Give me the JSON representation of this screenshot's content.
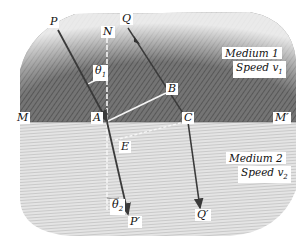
{
  "diagram": {
    "colors": {
      "medium1": "#6e6e6e",
      "medium2": "#d8d8d8",
      "background": "#ffffff",
      "ray": "#3a3a3a",
      "construction_line": "#f2f2f2"
    },
    "points": {
      "P": "P",
      "Q": "Q",
      "N": "N",
      "A": "A",
      "B": "B",
      "C": "C",
      "E": "E",
      "M": "M",
      "M_prime": "M′",
      "P_prime": "P′",
      "Q_prime": "Q′"
    },
    "angles": {
      "theta1": "θ",
      "theta1_sub": "1",
      "theta2": "θ",
      "theta2_sub": "2"
    },
    "medium1": {
      "name": "Medium 1",
      "speed_label": "Speed v",
      "speed_sub": "1"
    },
    "medium2": {
      "name": "Medium 2",
      "speed_label": "Speed v",
      "speed_sub": "2"
    }
  }
}
